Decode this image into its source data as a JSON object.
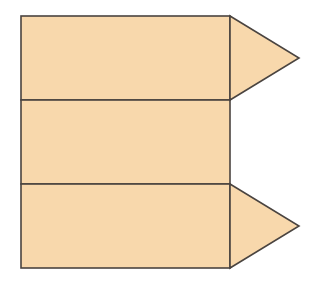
{
  "diagram": {
    "colors": {
      "fill": "#F8D8AC",
      "stroke": "#4a4440",
      "background": "#ffffff"
    },
    "rectangles": [
      {
        "id": "top",
        "x": 21,
        "y": 16,
        "width": 209,
        "height": 84
      },
      {
        "id": "middle",
        "x": 21,
        "y": 100,
        "width": 209,
        "height": 84
      },
      {
        "id": "bottom",
        "x": 21,
        "y": 184,
        "width": 209,
        "height": 84
      }
    ],
    "triangles": [
      {
        "id": "top-flap",
        "points": "230,16 299,58 230,100"
      },
      {
        "id": "bottom-flap",
        "points": "230,184 299,226 230,268"
      }
    ]
  }
}
